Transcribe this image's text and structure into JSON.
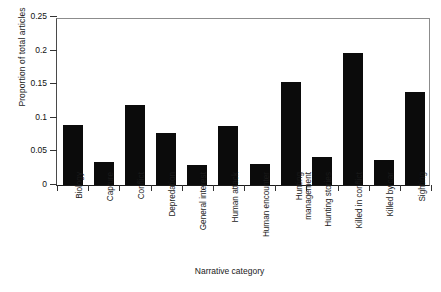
{
  "chart_data": {
    "type": "bar",
    "title": "",
    "xlabel": "Narrative category",
    "ylabel": "Proportion of total articles",
    "ylim": [
      0,
      0.25
    ],
    "yticks": [
      0,
      0.05,
      0.1,
      0.15,
      0.2,
      0.25
    ],
    "ytick_labels": [
      "0",
      "0.05",
      "0.1",
      "0.15",
      "0.2",
      "0.25"
    ],
    "grid": false,
    "legend": null,
    "bar_color": "#0b0b0b",
    "categories": [
      "Biology",
      "Capture",
      "Conflict",
      "Depredation",
      "General interest",
      "Human attack",
      "Human encounter",
      "Hunting management",
      "Hunting stories",
      "Killed in conflict",
      "Killed by car",
      "Sighting"
    ],
    "category_lines": [
      [
        "Biology"
      ],
      [
        "Capture"
      ],
      [
        "Conflict"
      ],
      [
        "Depredation"
      ],
      [
        "General interest"
      ],
      [
        "Human attack"
      ],
      [
        "Human encounter"
      ],
      [
        "Hunting",
        "management"
      ],
      [
        "Hunting stories"
      ],
      [
        "Killed in conflict"
      ],
      [
        "Killed by car"
      ],
      [
        "Sighting"
      ]
    ],
    "values": [
      0.09,
      0.034,
      0.119,
      0.077,
      0.03,
      0.088,
      0.031,
      0.153,
      0.041,
      0.197,
      0.037,
      0.138
    ]
  }
}
